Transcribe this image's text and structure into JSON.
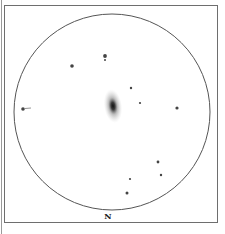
{
  "sketch": {
    "subject": "galaxy field sketch",
    "orientation_label": "N",
    "field_circle": {
      "cx": 112,
      "cy": 112,
      "r": 98,
      "stroke": "#555555"
    },
    "galaxy": {
      "cx": 113,
      "cy": 106,
      "rx": 9,
      "ry": 17,
      "core_color": "#1a1a1a",
      "halo_color": "#9a9a9a"
    },
    "stars": [
      {
        "x": 72,
        "y": 66,
        "r": 1.8
      },
      {
        "x": 105,
        "y": 56,
        "r": 1.9
      },
      {
        "x": 105,
        "y": 60,
        "r": 1.0
      },
      {
        "x": 131,
        "y": 88,
        "r": 1.2
      },
      {
        "x": 140,
        "y": 103,
        "r": 1.1
      },
      {
        "x": 177,
        "y": 108,
        "r": 1.6
      },
      {
        "x": 23,
        "y": 109,
        "r": 1.8
      },
      {
        "x": 158,
        "y": 162,
        "r": 1.4
      },
      {
        "x": 161,
        "y": 175,
        "r": 1.2
      },
      {
        "x": 130,
        "y": 179,
        "r": 1.1
      },
      {
        "x": 127,
        "y": 193,
        "r": 1.5
      }
    ]
  }
}
